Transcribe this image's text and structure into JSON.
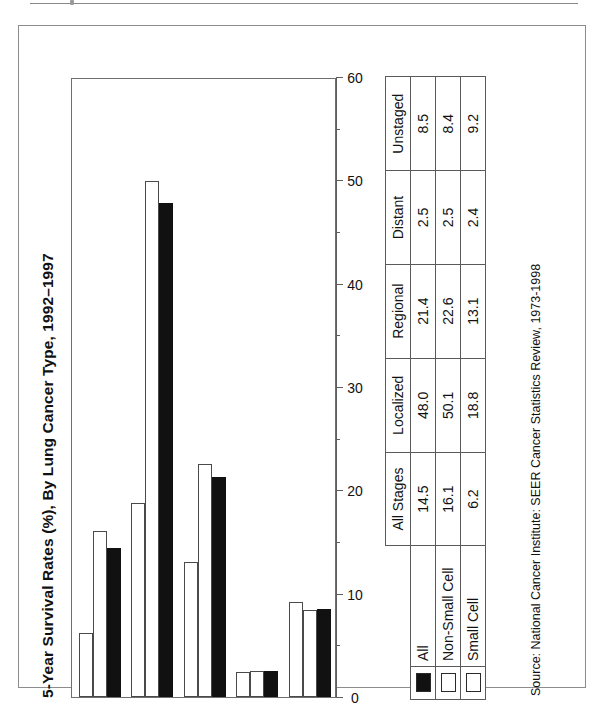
{
  "figure": {
    "title": "5-Year Survival Rates (%), By Lung Cancer Type, 1992–1997",
    "source_note": "Source: National Cancer Institute: SEER Cancer Statistics Review, 1973-1998"
  },
  "table": {
    "corner_label": "",
    "headers": [
      "All Stages",
      "Localized",
      "Regional",
      "Distant",
      "Unstaged"
    ],
    "rows": [
      {
        "label": "All",
        "swatch": "solid-black-swatch",
        "values": [
          "14.5",
          "48.0",
          "21.4",
          "2.5",
          "8.5"
        ]
      },
      {
        "label": "Non-Small Cell",
        "swatch": "hollow-white-swatch",
        "values": [
          "16.1",
          "50.1",
          "22.6",
          "2.5",
          "8.4"
        ]
      },
      {
        "label": "Small Cell",
        "swatch": "hollow-white-swatch",
        "values": [
          "6.2",
          "18.8",
          "13.1",
          "2.4",
          "9.2"
        ]
      }
    ]
  },
  "axis": {
    "ticks": [
      "0",
      "10",
      "20",
      "30",
      "40",
      "50",
      "60"
    ],
    "minor_ticks": [
      5,
      15,
      25,
      35,
      45,
      55
    ],
    "min": 0,
    "max": 60
  },
  "colors": {
    "series_all": "#111111",
    "series_non_small_cell": "#ffffff",
    "series_small_cell": "#ffffff",
    "bar_outline": "#4a4a4a",
    "frame": "#8c8c8c",
    "rule": "#8a8a8a"
  },
  "chart_data": {
    "type": "bar",
    "orientation": "vertical-rendered-rotated",
    "title": "5-Year Survival Rates (%), By Lung Cancer Type, 1992–1997",
    "xlabel": "",
    "ylabel": "",
    "ylim": [
      0,
      60
    ],
    "grid": false,
    "legend": "table-below",
    "categories": [
      "All Stages",
      "Localized",
      "Regional",
      "Distant",
      "Unstaged"
    ],
    "series": [
      {
        "name": "All",
        "fill": "black",
        "values": [
          14.5,
          48.0,
          21.4,
          2.5,
          8.5
        ]
      },
      {
        "name": "Non-Small Cell",
        "fill": "white",
        "values": [
          16.1,
          50.1,
          22.6,
          2.5,
          8.4
        ]
      },
      {
        "name": "Small Cell",
        "fill": "white",
        "values": [
          6.2,
          18.8,
          13.1,
          2.4,
          9.2
        ]
      }
    ],
    "annotations": [
      "Source: National Cancer Institute: SEER Cancer Statistics Review, 1973-1998"
    ]
  }
}
